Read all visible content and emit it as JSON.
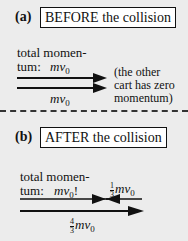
{
  "panel_a": {
    "label": "(a)",
    "title": "BEFORE the collision",
    "total_line1": "total momen-",
    "total_line2": "tum:",
    "total_value": "mv",
    "total_sub": "0",
    "arrow_label": "mv",
    "arrow_sub": "0",
    "note_line1": "(the other",
    "note_line2": "cart has zero",
    "note_line3": "momentum)"
  },
  "panel_b": {
    "label": "(b)",
    "title": "AFTER the collision",
    "total_line1": "total momen-",
    "total_line2": "tum:",
    "total_value": "mv",
    "total_sub": "0",
    "total_suffix": "!",
    "left_arrow_num": "1",
    "left_arrow_den": "3",
    "left_arrow_label": "mv",
    "left_arrow_sub": "0",
    "right_arrow_num": "4",
    "right_arrow_den": "3",
    "right_arrow_label": "mv",
    "right_arrow_sub": "0"
  }
}
